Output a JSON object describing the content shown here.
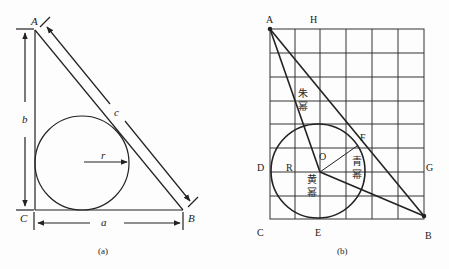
{
  "figure_a": {
    "caption": "(a)",
    "vertices": {
      "A": "A",
      "B": "B",
      "C": "C"
    },
    "sides": {
      "a": "a",
      "b": "b",
      "c": "c"
    },
    "radius": "r"
  },
  "figure_b": {
    "caption": "(b)",
    "points": {
      "A": "A",
      "H": "H",
      "D": "D",
      "R": "R",
      "O": "O",
      "F": "F",
      "G": "G",
      "C": "C",
      "E": "E",
      "B": "B"
    },
    "chinese_labels": {
      "upper": "朱\n幂",
      "right": "青\n幂",
      "center": "黄\n幂"
    },
    "grid": {
      "columns": 6,
      "rows": 8
    }
  },
  "colors": {
    "ink": "#222222",
    "background": "#fdfdfd"
  }
}
